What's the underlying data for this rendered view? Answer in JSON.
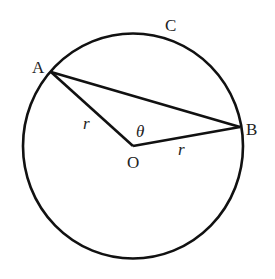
{
  "diagram": {
    "type": "circle-chord",
    "colors": {
      "stroke": "#111111",
      "background": "#ffffff",
      "text": "#222222"
    },
    "circle": {
      "center_label": "O"
    },
    "points": {
      "A": {
        "label": "A"
      },
      "B": {
        "label": "B"
      },
      "C": {
        "label": "C"
      },
      "O": {
        "label": "O"
      }
    },
    "segments": [
      {
        "from": "O",
        "to": "A",
        "label": "r"
      },
      {
        "from": "O",
        "to": "B",
        "label": "r"
      },
      {
        "from": "A",
        "to": "B",
        "label": ""
      }
    ],
    "angle": {
      "vertex": "O",
      "label": "θ"
    },
    "labels": {
      "a": "A",
      "b": "B",
      "c": "C",
      "o": "O",
      "r_oa": "r",
      "r_ob": "r",
      "theta": "θ"
    }
  }
}
